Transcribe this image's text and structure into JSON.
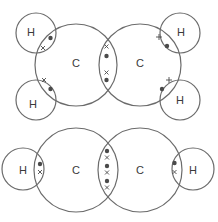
{
  "figure": {
    "title": "",
    "molecules": [
      {
        "name": "ethene",
        "atoms": [
          {
            "id": "C1",
            "label": "C",
            "cx": 76,
            "cy": 65,
            "r": 41
          },
          {
            "id": "C2",
            "label": "C",
            "cx": 140,
            "cy": 65,
            "r": 41
          },
          {
            "id": "H1",
            "label": "H",
            "cx": 36,
            "cy": 33,
            "r": 20
          },
          {
            "id": "H2",
            "label": "H",
            "cx": 36,
            "cy": 100,
            "r": 20
          },
          {
            "id": "H3",
            "label": "H",
            "cx": 180,
            "cy": 33,
            "r": 20
          },
          {
            "id": "H4",
            "label": "H",
            "cx": 180,
            "cy": 100,
            "r": 20
          }
        ],
        "bonds": [
          {
            "between": [
              "C1",
              "C2"
            ],
            "type": "double",
            "electrons": [
              "cross",
              "dot",
              "cross",
              "dot"
            ]
          },
          {
            "between": [
              "C1",
              "H1"
            ],
            "type": "single",
            "electrons": [
              "dot",
              "cross"
            ]
          },
          {
            "between": [
              "C1",
              "H2"
            ],
            "type": "single",
            "electrons": [
              "cross",
              "dot"
            ]
          },
          {
            "between": [
              "C2",
              "H3"
            ],
            "type": "single",
            "electrons": [
              "cross",
              "dot"
            ]
          },
          {
            "between": [
              "C2",
              "H4"
            ],
            "type": "single",
            "electrons": [
              "cross",
              "dot"
            ]
          }
        ]
      },
      {
        "name": "ethyne",
        "atoms": [
          {
            "id": "C1",
            "label": "C",
            "cx": 76,
            "cy": 170,
            "r": 42
          },
          {
            "id": "C2",
            "label": "C",
            "cx": 140,
            "cy": 170,
            "r": 42
          },
          {
            "id": "H1",
            "label": "H",
            "cx": 23,
            "cy": 169,
            "r": 21
          },
          {
            "id": "H2",
            "label": "H",
            "cx": 193,
            "cy": 169,
            "r": 21
          }
        ],
        "bonds": [
          {
            "between": [
              "C1",
              "C2"
            ],
            "type": "triple",
            "electrons": [
              "dot",
              "cross",
              "dot",
              "cross",
              "dot",
              "cross"
            ]
          },
          {
            "between": [
              "H1",
              "C1"
            ],
            "type": "single",
            "electrons": [
              "dot",
              "cross"
            ]
          },
          {
            "between": [
              "C2",
              "H2"
            ],
            "type": "single",
            "electrons": [
              "dot",
              "cross"
            ]
          }
        ]
      }
    ],
    "labels": {
      "carbon": "C",
      "hydrogen": "H"
    },
    "colors": {
      "stroke": "#6b6b6b",
      "electron": "#4a4a4a",
      "text": "#3a3a3a",
      "background": "#ffffff"
    }
  }
}
